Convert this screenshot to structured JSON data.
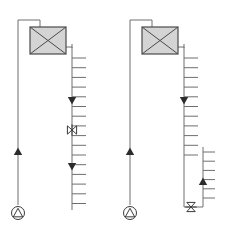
{
  "diagram": {
    "title": "Piping riser schematic",
    "background_color": "#ffffff",
    "line_color": "#6e6e6e",
    "symbol_color": "#3a3a3a",
    "unit_fill_color": "#d4d4d4",
    "unit_border_color": "#4a4a4a",
    "arrow_color": "#2b2b2b",
    "panels": [
      {
        "id": "panel-left",
        "name": "left-riser-assembly",
        "unit": {
          "name": "air-handling-unit",
          "symbol": "rectangle-with-x",
          "x": 30,
          "y": 27,
          "width": 36,
          "height": 27
        },
        "supply_riser": {
          "name": "supply-riser-left",
          "x": 18,
          "top_y": 20,
          "bottom_y": 205,
          "flow_arrow_direction": "up",
          "flow_arrow_y": 155
        },
        "return_riser": {
          "name": "return-riser-left",
          "x": 72,
          "top_y": 44,
          "bottom_y": 210,
          "branch_count": 16,
          "branch_length": 14,
          "branch_side": "right",
          "branch_start_y": 58,
          "branch_spacing": 9.7,
          "flow_arrows": [
            {
              "y": 97,
              "direction": "down"
            },
            {
              "y": 163,
              "direction": "down"
            }
          ],
          "valve": {
            "name": "balancing-valve",
            "symbol": "bowtie-valve",
            "y": 130
          }
        },
        "base_symbol": {
          "name": "pump-symbol",
          "symbol": "circle-with-triangle",
          "cx": 18,
          "cy": 213,
          "r": 6.5
        }
      },
      {
        "id": "panel-right",
        "name": "right-riser-assembly",
        "unit": {
          "name": "air-handling-unit",
          "symbol": "rectangle-with-x",
          "x": 142,
          "y": 27,
          "width": 36,
          "height": 27
        },
        "supply_riser": {
          "name": "supply-riser-right",
          "x": 130,
          "top_y": 20,
          "bottom_y": 205,
          "flow_arrow_direction": "up",
          "flow_arrow_y": 155
        },
        "return_riser": {
          "name": "return-riser-right",
          "x": 184,
          "top_y": 44,
          "bottom_y": 207,
          "branch_count": 11,
          "branch_length": 14,
          "branch_side": "right",
          "branch_start_y": 58,
          "branch_spacing": 9.7,
          "flow_arrows": [
            {
              "y": 97,
              "direction": "down"
            }
          ]
        },
        "secondary_riser": {
          "name": "secondary-riser-right",
          "x": 203,
          "top_y": 147,
          "bottom_y": 207,
          "branch_count": 7,
          "branch_length": 12,
          "branch_side": "right",
          "branch_start_y": 152,
          "branch_spacing": 9.2,
          "flow_arrows": [
            {
              "y": 185,
              "direction": "up"
            }
          ]
        },
        "base_valve": {
          "name": "isolation-valve",
          "symbol": "bowtie-valve",
          "x": 191,
          "y": 207
        },
        "base_symbol": {
          "name": "pump-symbol",
          "symbol": "circle-with-triangle",
          "cx": 130,
          "cy": 213,
          "r": 6.5
        }
      }
    ],
    "legend_labels": {
      "unit": "Air handling unit",
      "supply": "Supply riser",
      "return": "Return riser",
      "valve": "Balancing valve",
      "pump": "Pump"
    }
  }
}
